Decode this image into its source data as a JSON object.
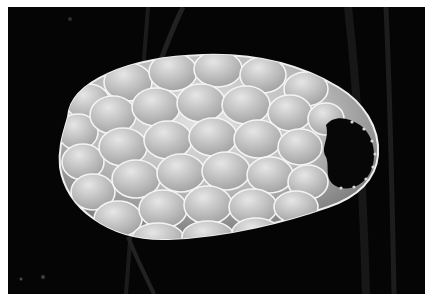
{
  "image": {
    "kind": "scanning electron micrograph",
    "subject": "scaled ovoid shell (testate amoeba) with aperture at right end",
    "alt": "Grayscale SEM image of an oval shell covered in overlapping rounded scales on a black background, aperture opening on the right",
    "colors": {
      "border": "#ffffff",
      "background": "#050505",
      "shell_light": "#d8d8d8",
      "shell_mid": "#a8a8a8",
      "scale_edge": "#f2f2f2",
      "aperture": "#080808"
    }
  }
}
